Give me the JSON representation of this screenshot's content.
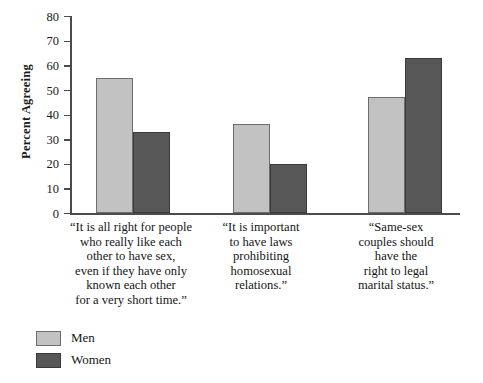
{
  "chart_data": {
    "type": "bar",
    "title": "",
    "xlabel": "",
    "ylabel": "Percent Agreeing",
    "ylim": [
      0,
      80
    ],
    "yticks": [
      0,
      10,
      20,
      30,
      40,
      50,
      60,
      70,
      80
    ],
    "grid": false,
    "legend_position": "bottom-left",
    "categories": [
      "“It is all right for people who really like each other to have sex, even if they have only known each other for a very short time.”",
      "“It is important to have laws prohibiting homosexual relations.”",
      "“Same-sex couples should have the right to legal marital status.”"
    ],
    "category_lines": [
      [
        "“It is all right for people",
        "who really like each",
        "other to have sex,",
        "even if they have only",
        "known each other",
        "for a very short time.”"
      ],
      [
        "“It is important",
        "to have laws",
        "prohibiting",
        "homosexual",
        "relations.”"
      ],
      [
        "“Same-sex",
        "couples should",
        "have the",
        "right to legal",
        "marital status.”"
      ]
    ],
    "series": [
      {
        "name": "Men",
        "color": "#c2c2c2",
        "values": [
          55,
          36,
          47
        ]
      },
      {
        "name": "Women",
        "color": "#575757",
        "values": [
          33,
          20,
          63
        ]
      }
    ]
  },
  "legend": {
    "items": [
      {
        "label": "Men"
      },
      {
        "label": "Women"
      }
    ]
  },
  "axis": {
    "y_title": "Percent Agreeing",
    "tick_labels": [
      "80",
      "70",
      "60",
      "50",
      "40",
      "30",
      "20",
      "10",
      "0"
    ]
  }
}
